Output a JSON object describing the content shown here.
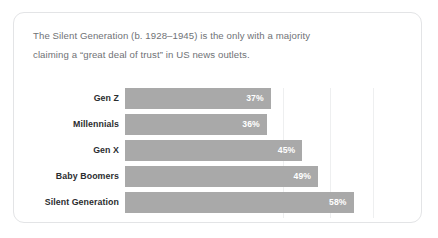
{
  "card": {
    "headline_line1": "The Silent Generation (b. 1928–1945) is the only with a majority",
    "headline_line2": "claiming a “great deal of trust” in US news outlets."
  },
  "chart_data": {
    "type": "bar",
    "orientation": "horizontal",
    "title": "The Silent Generation (b. 1928–1945) is the only with a majority claiming a “great deal of trust” in US news outlets.",
    "subtitle": "",
    "xlabel": "",
    "ylabel": "",
    "categories": [
      "Gen Z",
      "Millennials",
      "Gen X",
      "Baby Boomers",
      "Silent Generation"
    ],
    "values": [
      37,
      36,
      45,
      49,
      58
    ],
    "value_labels": [
      "37%",
      "36%",
      "45%",
      "49%",
      "58%"
    ],
    "xlim": [
      0,
      70
    ],
    "grid": true,
    "gridlines_at": [
      40,
      52,
      63
    ],
    "legend": "none",
    "bar_color": "#a9a9a9",
    "value_label_color": "#ffffff",
    "category_label_color": "#2b2d30"
  }
}
